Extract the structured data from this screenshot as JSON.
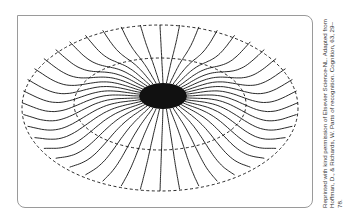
{
  "figure": {
    "colors": {
      "line": "#111111",
      "frame": "#9a9a9a",
      "background": "#ffffff"
    },
    "outer_ellipse": {
      "cx": 160,
      "cy": 108,
      "rx": 138,
      "ry": 83
    },
    "inner_ellipse": {
      "cx": 160,
      "cy": 104,
      "rx": 86,
      "ry": 46
    },
    "core": {
      "cx": 163,
      "cy": 96,
      "rx": 24,
      "ry": 13
    },
    "radial_count": 44
  },
  "credit": {
    "text": "Reprinted with kind permission of Elsevier Science-NL. Adapted from Hoffman, D., & Richards, W. Parts of recognition. Cognition, 63, 29–78."
  }
}
